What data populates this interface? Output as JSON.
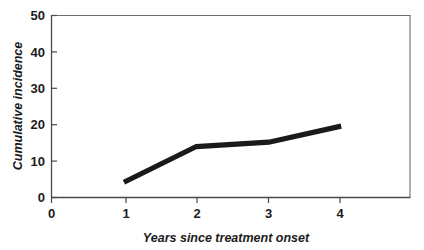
{
  "chart_data": {
    "type": "line",
    "title": "",
    "xlabel": "Years since treatment onset",
    "ylabel": "Cumulative incidence",
    "x": [
      1,
      2,
      3,
      4
    ],
    "values": [
      4.2,
      14.0,
      15.2,
      19.6
    ],
    "series": [
      {
        "name": "Cumulative incidence",
        "x": [
          1,
          2,
          3,
          4
        ],
        "values": [
          4.2,
          14.0,
          15.2,
          19.6
        ]
      }
    ],
    "xlim": [
      0,
      4.95
    ],
    "ylim": [
      0,
      50
    ],
    "xticks": [
      0,
      1,
      2,
      3,
      4
    ],
    "yticks": [
      0,
      10,
      20,
      30,
      40,
      50
    ],
    "xtick_labels": [
      "0",
      "1",
      "2",
      "3",
      "4"
    ],
    "ytick_labels": [
      "0",
      "10",
      "20",
      "30",
      "40",
      "50"
    ],
    "grid": false,
    "legend": false,
    "legend_position": "none",
    "line_color": "#1a1a1a",
    "background_color": "#ffffff",
    "axis_color": "#4a4a4a"
  }
}
